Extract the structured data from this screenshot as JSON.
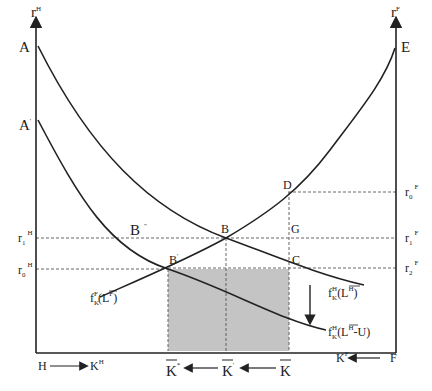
{
  "diagram": {
    "type": "two-country capital market diagram",
    "axes": {
      "left_axis_label": "r",
      "left_axis_sup": "H",
      "right_axis_label": "r",
      "right_axis_sup": "F",
      "bottom_left_origin": "H",
      "bottom_left_var": "K",
      "bottom_left_var_sup": "H",
      "bottom_right_origin": "F",
      "bottom_right_var": "K",
      "bottom_right_var_sup": "F"
    },
    "points": {
      "A": "A",
      "A_prime": "A",
      "A_prime_mark": "'",
      "E": "E",
      "B": "B",
      "B_prime": "B",
      "B_prime_mark": "'",
      "B_double": "B",
      "B_double_mark": "\"",
      "D": "D",
      "G": "G",
      "C": "C"
    },
    "left_rates": [
      {
        "base": "r",
        "sub": "1",
        "sup": "H"
      },
      {
        "base": "r",
        "sub": "0",
        "sup": "H"
      }
    ],
    "right_rates": [
      {
        "base": "r",
        "sub": "0",
        "sup": "F"
      },
      {
        "base": "r",
        "sub": "1",
        "sup": "F"
      },
      {
        "base": "r",
        "sub": "2",
        "sup": "F"
      }
    ],
    "curves": {
      "foreign": {
        "f": "f",
        "sub": "K",
        "sup": "F",
        "arg": "(L",
        "arg_sup": "F",
        "close": ")"
      },
      "home": {
        "f": "f",
        "sub": "K",
        "sup": "H",
        "arg": "(L",
        "arg_sup": "H",
        "close": ")"
      },
      "home_shifted": {
        "f": "f",
        "sub": "K",
        "sup": "H",
        "arg": "(L",
        "arg_sup": "H",
        "close": "-U)"
      }
    },
    "capital_levels": [
      {
        "base": "K",
        "mark": "*"
      },
      {
        "base": "K",
        "mark": "'"
      },
      {
        "base": "K",
        "mark": ""
      }
    ],
    "colors": {
      "line": "#222222",
      "shaded_area": "#c4c4c4",
      "dashed": "#555555"
    }
  }
}
